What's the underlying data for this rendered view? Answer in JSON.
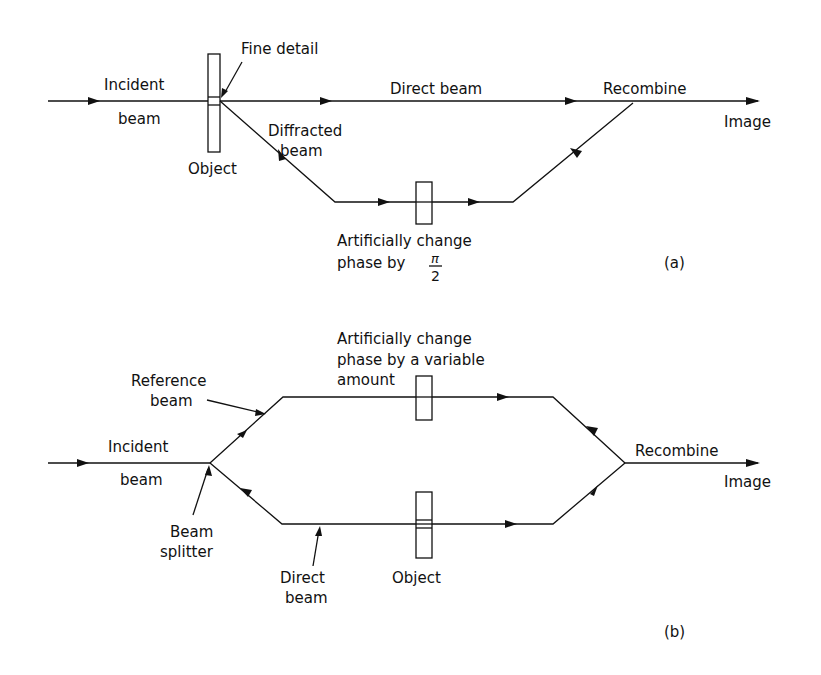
{
  "diagram_a": {
    "panel_label": "(a)",
    "labels": {
      "incident_1": "Incident",
      "incident_2": "beam",
      "fine_detail": "Fine detail",
      "object": "Object",
      "direct_beam": "Direct beam",
      "diffracted_1": "Diffracted",
      "diffracted_2": "beam",
      "recombine": "Recombine",
      "image": "Image",
      "phase_1": "Artificially change",
      "phase_2": "phase by",
      "pi": "π",
      "two": "2"
    }
  },
  "diagram_b": {
    "panel_label": "(b)",
    "labels": {
      "phase_1": "Artificially change",
      "phase_2": "phase by a variable",
      "phase_3": "amount",
      "reference_1": "Reference",
      "reference_2": "beam",
      "incident_1": "Incident",
      "incident_2": "beam",
      "splitter_1": "Beam",
      "splitter_2": "splitter",
      "direct_1": "Direct",
      "direct_2": "beam",
      "object": "Object",
      "recombine": "Recombine",
      "image": "Image"
    }
  }
}
